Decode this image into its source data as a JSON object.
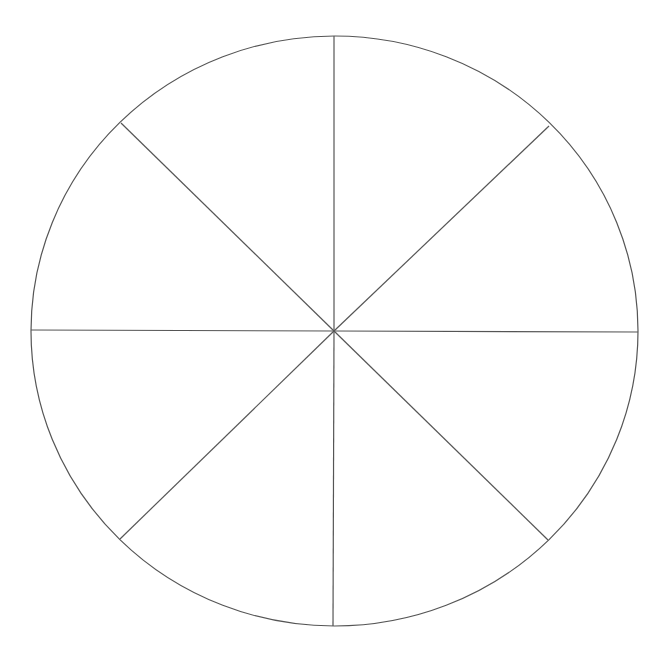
{
  "diagram": {
    "type": "sectored-circle",
    "sector_count": 8,
    "sector_angle_deg": 45,
    "stroke_color": "#555555",
    "fill_color": "#ffffff",
    "background_color": "#ffffff",
    "circle": {
      "cx": 334.5,
      "cy": 331,
      "rx": 303.5,
      "ry": 295
    },
    "center": {
      "x": 334,
      "y": 331
    },
    "spokes": [
      {
        "name": "spoke-top",
        "x": 334,
        "y": 36
      },
      {
        "name": "spoke-top-right",
        "x": 549,
        "y": 126
      },
      {
        "name": "spoke-right",
        "x": 638,
        "y": 332
      },
      {
        "name": "spoke-bottom-right",
        "x": 548,
        "y": 540
      },
      {
        "name": "spoke-bottom",
        "x": 333,
        "y": 626
      },
      {
        "name": "spoke-bottom-left",
        "x": 120,
        "y": 539
      },
      {
        "name": "spoke-left",
        "x": 31,
        "y": 330
      },
      {
        "name": "spoke-top-left",
        "x": 121,
        "y": 123
      }
    ]
  },
  "chart_data": {
    "type": "pie",
    "title": "",
    "categories": [
      "",
      "",
      "",
      "",
      "",
      "",
      "",
      ""
    ],
    "values": [
      12.5,
      12.5,
      12.5,
      12.5,
      12.5,
      12.5,
      12.5,
      12.5
    ],
    "labels_shown": false,
    "legend": "none",
    "note": "Unlabeled circle divided into 8 equal 45° sectors"
  }
}
